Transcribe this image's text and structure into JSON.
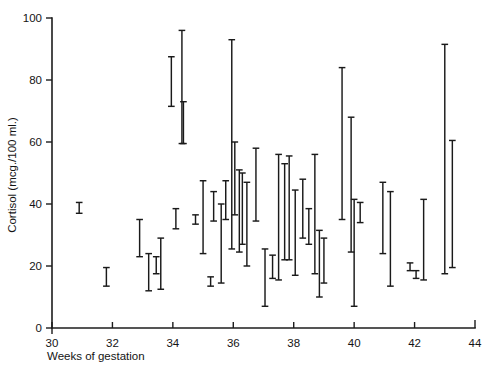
{
  "chart_data": {
    "type": "range",
    "title": "",
    "xlabel": "Weeks of gestation",
    "ylabel": "Cortisol (mcg./100 ml.)",
    "xlim": [
      30,
      44
    ],
    "ylim": [
      0,
      100
    ],
    "xticks": [
      30,
      32,
      34,
      36,
      38,
      40,
      42,
      44
    ],
    "xtick_labels": [
      "30",
      "32",
      "34",
      "36",
      "38",
      "40",
      "42",
      "44"
    ],
    "yticks": [
      0,
      20,
      40,
      60,
      80,
      100
    ],
    "ytick_labels": [
      "0",
      "20",
      "40",
      "60",
      "80",
      "100"
    ],
    "grid": false,
    "legend": null,
    "marker_style": "vertical-range-with-end-caps",
    "cap_width_units": 0.22,
    "series": [
      {
        "name": "Cortisol range per subject",
        "color": "#1a1a1a",
        "points": [
          {
            "x": 30.9,
            "low": 37.0,
            "high": 40.5
          },
          {
            "x": 31.8,
            "low": 13.5,
            "high": 19.5
          },
          {
            "x": 32.9,
            "low": 23.0,
            "high": 35.0
          },
          {
            "x": 33.2,
            "low": 12.0,
            "high": 24.0
          },
          {
            "x": 33.45,
            "low": 17.5,
            "high": 23.0
          },
          {
            "x": 33.6,
            "low": 12.5,
            "high": 29.0
          },
          {
            "x": 33.95,
            "low": 71.5,
            "high": 87.5
          },
          {
            "x": 34.1,
            "low": 32.0,
            "high": 38.5
          },
          {
            "x": 34.3,
            "low": 59.5,
            "high": 96.0
          },
          {
            "x": 34.35,
            "low": 59.5,
            "high": 73.0
          },
          {
            "x": 34.75,
            "low": 33.5,
            "high": 36.5
          },
          {
            "x": 35.0,
            "low": 24.0,
            "high": 47.5
          },
          {
            "x": 35.25,
            "low": 13.5,
            "high": 16.5
          },
          {
            "x": 35.35,
            "low": 34.5,
            "high": 44.0
          },
          {
            "x": 35.6,
            "low": 14.5,
            "high": 40.0
          },
          {
            "x": 35.75,
            "low": 35.0,
            "high": 47.5
          },
          {
            "x": 35.95,
            "low": 25.5,
            "high": 93.0
          },
          {
            "x": 36.05,
            "low": 36.5,
            "high": 60.0
          },
          {
            "x": 36.2,
            "low": 24.5,
            "high": 51.0
          },
          {
            "x": 36.3,
            "low": 27.0,
            "high": 50.0
          },
          {
            "x": 36.45,
            "low": 20.0,
            "high": 47.0
          },
          {
            "x": 36.75,
            "low": 34.5,
            "high": 58.0
          },
          {
            "x": 37.05,
            "low": 7.0,
            "high": 25.5
          },
          {
            "x": 37.3,
            "low": 16.0,
            "high": 23.5
          },
          {
            "x": 37.5,
            "low": 15.5,
            "high": 56.0
          },
          {
            "x": 37.7,
            "low": 22.0,
            "high": 53.0
          },
          {
            "x": 37.85,
            "low": 22.0,
            "high": 55.5
          },
          {
            "x": 38.05,
            "low": 17.0,
            "high": 44.5
          },
          {
            "x": 38.3,
            "low": 29.0,
            "high": 48.0
          },
          {
            "x": 38.5,
            "low": 27.0,
            "high": 38.5
          },
          {
            "x": 38.7,
            "low": 17.5,
            "high": 56.0
          },
          {
            "x": 38.85,
            "low": 10.0,
            "high": 31.5
          },
          {
            "x": 39.0,
            "low": 14.5,
            "high": 29.0
          },
          {
            "x": 39.6,
            "low": 35.0,
            "high": 84.0
          },
          {
            "x": 39.9,
            "low": 24.5,
            "high": 68.0
          },
          {
            "x": 40.0,
            "low": 7.0,
            "high": 41.5
          },
          {
            "x": 40.2,
            "low": 34.0,
            "high": 40.5
          },
          {
            "x": 40.95,
            "low": 24.0,
            "high": 47.0
          },
          {
            "x": 41.2,
            "low": 13.5,
            "high": 44.0
          },
          {
            "x": 41.85,
            "low": 18.5,
            "high": 21.0
          },
          {
            "x": 42.05,
            "low": 16.0,
            "high": 18.5
          },
          {
            "x": 42.3,
            "low": 15.5,
            "high": 41.5
          },
          {
            "x": 43.0,
            "low": 17.5,
            "high": 91.5
          },
          {
            "x": 43.25,
            "low": 19.5,
            "high": 60.5
          }
        ]
      }
    ]
  }
}
